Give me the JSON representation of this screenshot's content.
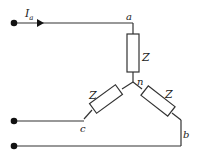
{
  "diagram": {
    "current_label": "I",
    "current_subscript": "a",
    "nodes": {
      "a": "a",
      "b": "b",
      "c": "c",
      "n": "n"
    },
    "impedances": [
      "Z",
      "Z",
      "Z"
    ],
    "colors": {
      "line": "#333333",
      "terminal": "#111111",
      "background": "#ffffff"
    }
  }
}
